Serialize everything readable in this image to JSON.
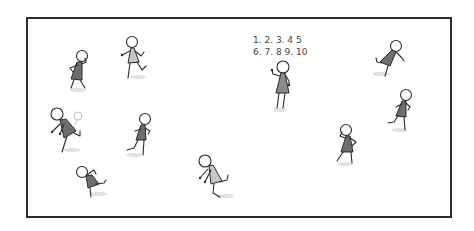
{
  "scene": {
    "description": "Hand-drawn stick figures playing hide-and-seek inside a rectangular frame; one figure counts aloud",
    "background": "#ffffff",
    "frame": {
      "x": 27,
      "y": 18,
      "width": 424,
      "height": 199,
      "color": "#2b2b2b"
    },
    "counting": {
      "line1": "1. 2. 3. 4 5",
      "line2": "6. 7. 8 9. 10"
    },
    "colors": {
      "outline": "#2b2b2b",
      "dress_dark": "#6e6e6e",
      "dress_light": "#b8b8b8",
      "shadow": "#d9d9d9"
    },
    "figures": [
      {
        "id": "counter",
        "pose": "counting, facing forward",
        "x": 282,
        "y": 68
      },
      {
        "id": "runner-1",
        "pose": "hands near face",
        "x": 80,
        "y": 57
      },
      {
        "id": "runner-2",
        "pose": "running left, light dress",
        "x": 133,
        "y": 43
      },
      {
        "id": "runner-3",
        "pose": "running, leaning",
        "x": 58,
        "y": 115
      },
      {
        "id": "runner-4",
        "pose": "running left",
        "x": 145,
        "y": 120
      },
      {
        "id": "runner-5",
        "pose": "crouching run",
        "x": 83,
        "y": 172
      },
      {
        "id": "runner-6",
        "pose": "running, light dress",
        "x": 206,
        "y": 162
      },
      {
        "id": "runner-7",
        "pose": "running left",
        "x": 397,
        "y": 47
      },
      {
        "id": "runner-8",
        "pose": "running left",
        "x": 405,
        "y": 96
      },
      {
        "id": "runner-9",
        "pose": "hands near face",
        "x": 347,
        "y": 131
      }
    ]
  }
}
